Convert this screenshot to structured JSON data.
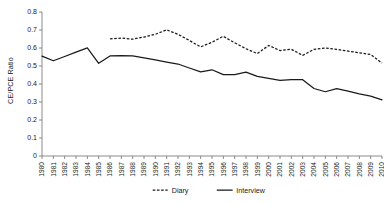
{
  "chart_data": {
    "type": "line",
    "title": "",
    "xlabel": "",
    "ylabel": "CE/PCE Ratio",
    "ylim": [
      0,
      0.8
    ],
    "ytick_step": 0.1,
    "yticks": [
      "0",
      "0.1",
      "0.2",
      "0.3",
      "0.4",
      "0.5",
      "0.6",
      "0.7",
      "0.8"
    ],
    "grid": false,
    "legend_position": "bottom",
    "x": [
      1980,
      1981,
      1982,
      1983,
      1984,
      1985,
      1986,
      1987,
      1988,
      1989,
      1990,
      1991,
      1992,
      1993,
      1994,
      1995,
      1996,
      1997,
      1998,
      1999,
      2000,
      2001,
      2002,
      2003,
      2004,
      2005,
      2006,
      2007,
      2008,
      2009,
      2010
    ],
    "categories": [
      "1980",
      "1981",
      "1982",
      "1983",
      "1984",
      "1985",
      "1986",
      "1987",
      "1988",
      "1989",
      "1990",
      "1991",
      "1992",
      "1993",
      "1994",
      "1995",
      "1996",
      "1997",
      "1998",
      "1999",
      "2000",
      "2001",
      "2002",
      "2003",
      "2004",
      "2005",
      "2006",
      "2007",
      "2008",
      "2009",
      "2010"
    ],
    "series": [
      {
        "name": "Diary",
        "style": "dashed",
        "color": "#1a1a1a",
        "values": [
          null,
          null,
          null,
          null,
          null,
          null,
          0.651,
          0.655,
          0.649,
          0.661,
          0.676,
          0.701,
          0.676,
          0.642,
          0.606,
          0.632,
          0.665,
          0.629,
          0.596,
          0.569,
          0.614,
          0.586,
          0.593,
          0.559,
          0.593,
          0.6,
          0.592,
          0.583,
          0.573,
          0.564,
          0.516
        ]
      },
      {
        "name": "Interview",
        "style": "solid",
        "color": "#1a1a1a",
        "values": [
          0.555,
          0.529,
          0.553,
          0.577,
          0.601,
          0.515,
          0.556,
          0.557,
          0.556,
          0.545,
          0.534,
          0.522,
          0.511,
          0.489,
          0.467,
          0.479,
          0.452,
          0.452,
          0.466,
          0.442,
          0.431,
          0.42,
          0.424,
          0.424,
          0.375,
          0.357,
          0.374,
          0.36,
          0.345,
          0.333,
          0.312
        ]
      }
    ]
  },
  "legend": {
    "items": [
      {
        "label": "Diary",
        "style": "dashed"
      },
      {
        "label": "Interview",
        "style": "solid"
      }
    ]
  }
}
